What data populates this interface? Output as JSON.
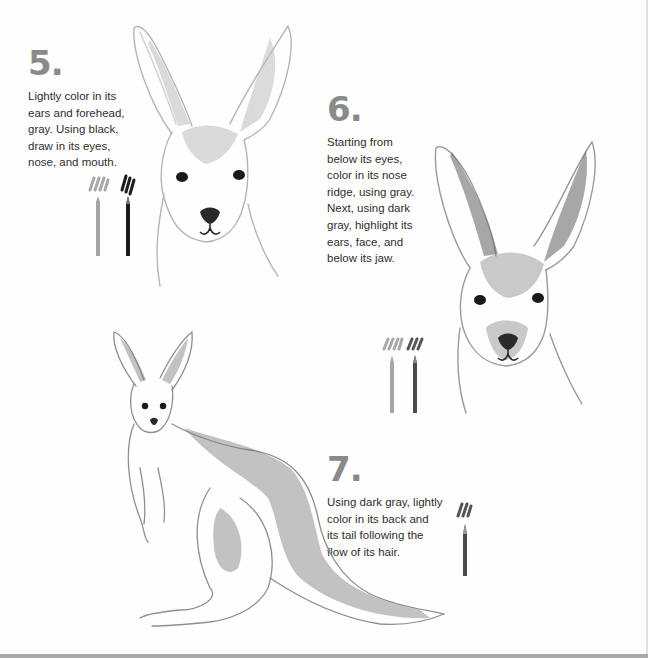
{
  "page": {
    "background": "#ffffff",
    "bottom_strip_color": "#a9a9a9"
  },
  "steps": [
    {
      "number": "5",
      "dot": ".",
      "text": "Lightly color in its ears and forehead, gray. Using black, draw in its eyes, nose, and mouth.",
      "lines": [
        "Lightly color in its",
        "ears and forehead,",
        "gray. Using black,",
        "draw in its eyes,",
        "nose, and mouth."
      ],
      "pencils": [
        "gray",
        "black"
      ],
      "illustration": "kangaroo-head-sketch-step5"
    },
    {
      "number": "6",
      "dot": ".",
      "text": "Starting from below its eyes, color in its nose ridge, using gray. Next, using dark gray, highlight its ears, face, and below its jaw.",
      "lines": [
        "Starting from",
        "below its eyes,",
        "color in its nose",
        "ridge, using gray.",
        "Next, using dark",
        "gray, highlight its",
        "ears, face, and",
        "below its jaw."
      ],
      "pencils": [
        "gray",
        "dark-gray"
      ],
      "illustration": "kangaroo-head-sketch-step6"
    },
    {
      "number": "7",
      "dot": ".",
      "text": "Using dark gray, lightly color in its back and its tail following the flow of its hair.",
      "lines": [
        "Using dark gray, lightly",
        "color in its back and",
        "its tail following the",
        "flow of its hair."
      ],
      "pencils": [
        "dark-gray"
      ],
      "illustration": "kangaroo-full-body-sketch-step7"
    }
  ],
  "colors": {
    "heading": "#8a8a8a",
    "body_text": "#2e2e2e",
    "pencil_gray": "#9a9a9a",
    "pencil_dark_gray": "#555555",
    "pencil_black": "#1a1a1a"
  }
}
